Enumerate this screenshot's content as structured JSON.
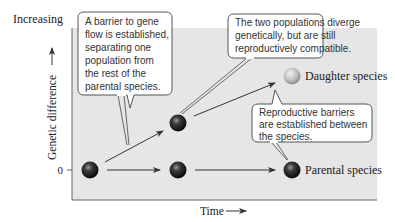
{
  "axes": {
    "y_top_label": "Increasing",
    "y_label": "Genetic difference",
    "y_zero_label": "0",
    "x_label": "Time"
  },
  "nodes": [
    {
      "id": "start",
      "kind": "parental",
      "time_step": 0,
      "divergence": 0
    },
    {
      "id": "diverging",
      "kind": "parental",
      "time_step": 1,
      "divergence": 0.5
    },
    {
      "id": "mid-parental",
      "kind": "parental",
      "time_step": 1,
      "divergence": 0
    },
    {
      "id": "daughter",
      "kind": "daughter",
      "time_step": 2,
      "divergence": 1
    },
    {
      "id": "end-parental",
      "kind": "parental",
      "time_step": 2,
      "divergence": 0
    }
  ],
  "labels": {
    "daughter": "Daughter species",
    "parental": "Parental species"
  },
  "callouts": {
    "barrier": [
      "A barrier to gene",
      "flow is established,",
      "separating one",
      "population from",
      "the rest of the",
      "parental species."
    ],
    "diverge": [
      "The two populations diverge",
      "genetically, but are still",
      "reproductively compatible."
    ],
    "reproductive": [
      "Reproductive barriers",
      "are established between",
      "the species."
    ]
  },
  "colors": {
    "panel": "#e6e6e6",
    "axis": "#666666",
    "dark_ball": "#222222",
    "light_ball": "#bdbdbd",
    "callout_border": "#555555"
  }
}
